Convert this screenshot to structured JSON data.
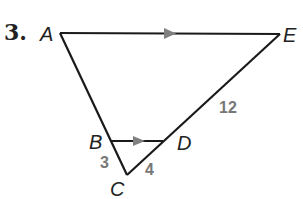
{
  "problem": {
    "number": "3."
  },
  "colors": {
    "line": "#1a1a1a",
    "arrow": "#808080",
    "measure": "#777777"
  },
  "vertices": {
    "A": {
      "label": "A",
      "x": 60,
      "y": 33
    },
    "E": {
      "label": "E",
      "x": 280,
      "y": 34
    },
    "B": {
      "label": "B",
      "x": 110,
      "y": 141
    },
    "D": {
      "label": "D",
      "x": 163,
      "y": 141
    },
    "C": {
      "label": "C",
      "x": 127,
      "y": 175
    }
  },
  "segments": [
    {
      "from": "A",
      "to": "E",
      "parallel_mark": true
    },
    {
      "from": "A",
      "to": "C"
    },
    {
      "from": "E",
      "to": "C"
    },
    {
      "from": "B",
      "to": "D",
      "parallel_mark": true
    }
  ],
  "measures": {
    "BC": "3",
    "CD": "4",
    "DE": "12"
  }
}
